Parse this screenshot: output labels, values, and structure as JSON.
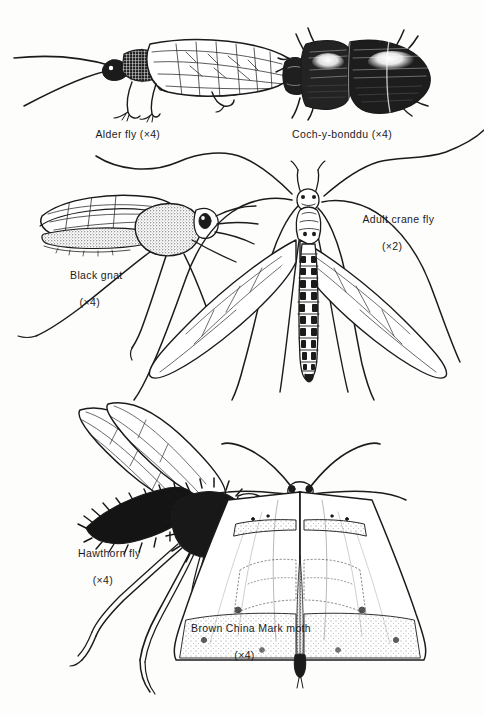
{
  "plate": {
    "title": "Insect plate — pen and ink illustrations",
    "background_color": "#fdfdfc",
    "ink_color": "#1b1b1b",
    "width": 484,
    "height": 715
  },
  "figures": [
    {
      "id": "alder-fly",
      "name": "Alder fly",
      "caption_line1": "Alder fly (×4)",
      "caption_line2": "",
      "magnification": "×4",
      "position": "top-left"
    },
    {
      "id": "coch-y-bonddu",
      "name": "Coch-y-bonddu",
      "caption_line1": "Coch-y-bonddu (×4)",
      "caption_line2": "",
      "magnification": "×4",
      "position": "top-right"
    },
    {
      "id": "black-gnat",
      "name": "Black gnat",
      "caption_line1": "Black gnat",
      "caption_line2": "(×4)",
      "magnification": "×4",
      "position": "middle-left"
    },
    {
      "id": "adult-crane-fly",
      "name": "Adult crane fly",
      "caption_line1": "Adult crane fly",
      "caption_line2": "(×2)",
      "magnification": "×2",
      "position": "middle-right"
    },
    {
      "id": "hawthorn-fly",
      "name": "Hawthorn fly",
      "caption_line1": "Hawthorn fly",
      "caption_line2": "(×4)",
      "magnification": "×4",
      "position": "bottom-left"
    },
    {
      "id": "brown-china-mark-moth",
      "name": "Brown China Mark moth",
      "caption_line1": "Brown China Mark moth",
      "caption_line2": "(×4)",
      "magnification": "×4",
      "position": "bottom-right"
    }
  ]
}
